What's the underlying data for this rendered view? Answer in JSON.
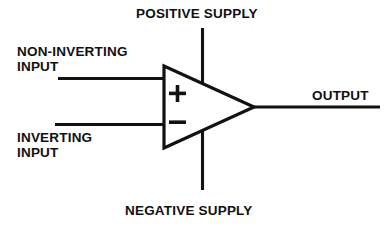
{
  "diagram": {
    "type": "op-amp-symbol",
    "background_color": "#ffffff",
    "line_color": "#121212",
    "text_color": "#101010"
  },
  "labels": {
    "positive_supply": "POSITIVE SUPPLY",
    "negative_supply": "NEGATIVE SUPPLY",
    "noninverting_input": "NON-INVERTING\nINPUT",
    "inverting_input": "INVERTING\nINPUT",
    "output": "OUTPUT"
  },
  "terminals": [
    {
      "name": "positive-supply",
      "label": "POSITIVE SUPPLY",
      "side": "top",
      "polarity": "+V"
    },
    {
      "name": "negative-supply",
      "label": "NEGATIVE SUPPLY",
      "side": "bottom",
      "polarity": "-V"
    },
    {
      "name": "noninverting-input",
      "label": "NON-INVERTING INPUT",
      "side": "left",
      "polarity": "+"
    },
    {
      "name": "inverting-input",
      "label": "INVERTING INPUT",
      "side": "left",
      "polarity": "-"
    },
    {
      "name": "output",
      "label": "OUTPUT",
      "side": "right",
      "polarity": ""
    }
  ],
  "polarity_marks": {
    "plus": "+",
    "minus": "−"
  }
}
